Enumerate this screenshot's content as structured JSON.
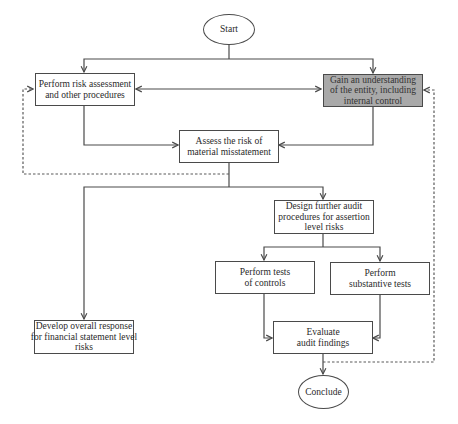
{
  "diagram": {
    "type": "flowchart",
    "colors": {
      "line": "#4a4a4a",
      "dashed_line": "#5a5a5a",
      "highlight_fill": "#a9a9a9",
      "box_fill": "#ffffff"
    },
    "nodes": {
      "start": {
        "label": "Start",
        "shape": "ellipse"
      },
      "risk_assessment": {
        "label": "Perform risk assessment and other procedures",
        "shape": "rectangle"
      },
      "understand_entity": {
        "label": "Gain an understanding of the entity, including internal control",
        "shape": "rectangle",
        "highlighted": true
      },
      "assess_risk": {
        "label": "Assess the risk of material misstatement",
        "shape": "rectangle"
      },
      "design_procedures": {
        "label": "Design further audit procedures for assertion level risks",
        "shape": "rectangle"
      },
      "tests_of_controls": {
        "label": "Perform tests of controls",
        "shape": "rectangle"
      },
      "substantive_tests": {
        "label": "Perform substantive tests",
        "shape": "rectangle"
      },
      "overall_response": {
        "label": "Develop overall response for financial statement level risks",
        "shape": "rectangle"
      },
      "evaluate_findings": {
        "label": "Evaluate audit findings",
        "shape": "rectangle"
      },
      "conclude": {
        "label": "Conclude",
        "shape": "ellipse"
      }
    },
    "edges": [
      {
        "from": "start",
        "to": "risk_assessment",
        "style": "solid"
      },
      {
        "from": "start",
        "to": "understand_entity",
        "style": "solid"
      },
      {
        "from": "risk_assessment",
        "to": "understand_entity",
        "style": "solid",
        "bidirectional": true
      },
      {
        "from": "risk_assessment",
        "to": "assess_risk",
        "style": "solid"
      },
      {
        "from": "understand_entity",
        "to": "assess_risk",
        "style": "solid"
      },
      {
        "from": "assess_risk",
        "to": "risk_assessment",
        "style": "dashed"
      },
      {
        "from": "assess_risk",
        "to": "overall_response",
        "style": "solid"
      },
      {
        "from": "assess_risk",
        "to": "design_procedures",
        "style": "solid"
      },
      {
        "from": "design_procedures",
        "to": "tests_of_controls",
        "style": "solid"
      },
      {
        "from": "design_procedures",
        "to": "substantive_tests",
        "style": "solid"
      },
      {
        "from": "tests_of_controls",
        "to": "evaluate_findings",
        "style": "solid"
      },
      {
        "from": "substantive_tests",
        "to": "evaluate_findings",
        "style": "solid"
      },
      {
        "from": "evaluate_findings",
        "to": "conclude",
        "style": "solid"
      },
      {
        "from": "evaluate_findings",
        "to": "understand_entity",
        "style": "dashed"
      }
    ]
  },
  "labels": {
    "start": "Start",
    "risk_assessment": [
      "Perform risk assessment",
      "and other procedures"
    ],
    "understand_entity": [
      "Gain an understanding",
      "of the entity, including",
      "internal control"
    ],
    "assess_risk": [
      "Assess the risk of",
      "material misstatement"
    ],
    "design_procedures": [
      "Design further audit",
      "procedures for assertion",
      "level risks"
    ],
    "tests_of_controls": [
      "Perform tests",
      "of controls"
    ],
    "substantive_tests": [
      "Perform",
      "substantive tests"
    ],
    "overall_response": [
      "Develop overall response",
      "for financial statement level",
      "risks"
    ],
    "evaluate_findings": [
      "Evaluate",
      "audit findings"
    ],
    "conclude": "Conclude"
  }
}
